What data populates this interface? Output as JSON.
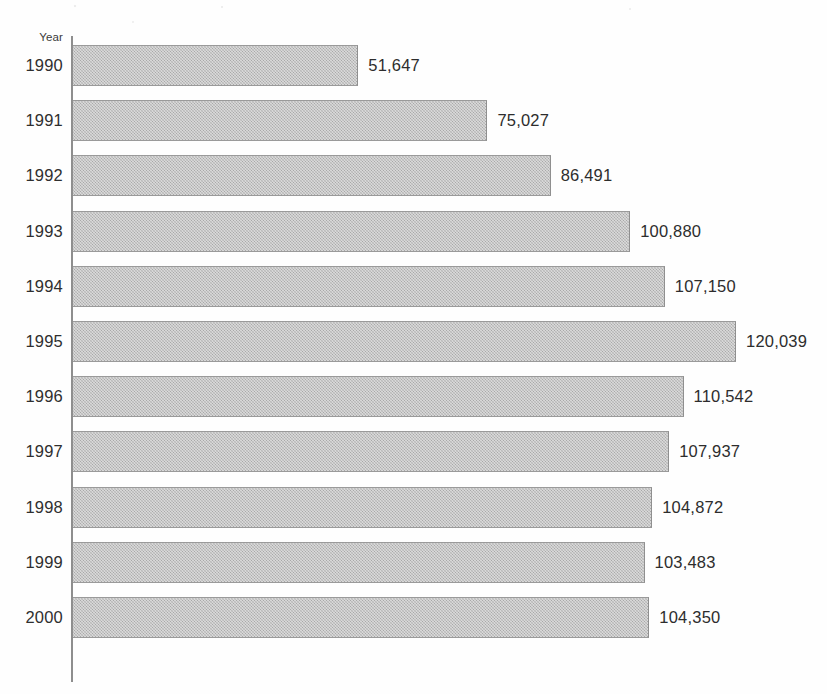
{
  "chart_data": {
    "type": "bar",
    "orientation": "horizontal",
    "title": "",
    "xlabel": "",
    "ylabel": "Year",
    "axis_label": "Year",
    "grid": false,
    "legend": null,
    "xlim": [
      0,
      120039
    ],
    "categories": [
      "1990",
      "1991",
      "1992",
      "1993",
      "1994",
      "1995",
      "1996",
      "1997",
      "1998",
      "1999",
      "2000"
    ],
    "values": [
      51647,
      75027,
      86491,
      100880,
      107150,
      120039,
      110542,
      107937,
      104872,
      103483,
      104350
    ],
    "value_labels": [
      "51,647",
      "75,027",
      "86,491",
      "100,880",
      "107,150",
      "120,039",
      "110,542",
      "107,937",
      "104,872",
      "103,483",
      "104,350"
    ],
    "bar_fill_color": "#b6b6b6",
    "bar_border_color": "#9a9a9a",
    "axis_color": "#8e8e8e",
    "text_color": "#2d2d2d"
  },
  "rows": [
    {
      "year": "1990",
      "value_label": "51,647"
    },
    {
      "year": "1991",
      "value_label": "75,027"
    },
    {
      "year": "1992",
      "value_label": "86,491"
    },
    {
      "year": "1993",
      "value_label": "100,880"
    },
    {
      "year": "1994",
      "value_label": "107,150"
    },
    {
      "year": "1995",
      "value_label": "120,039"
    },
    {
      "year": "1996",
      "value_label": "110,542"
    },
    {
      "year": "1997",
      "value_label": "107,937"
    },
    {
      "year": "1998",
      "value_label": "104,872"
    },
    {
      "year": "1999",
      "value_label": "103,483"
    },
    {
      "year": "2000",
      "value_label": "104,350"
    }
  ]
}
